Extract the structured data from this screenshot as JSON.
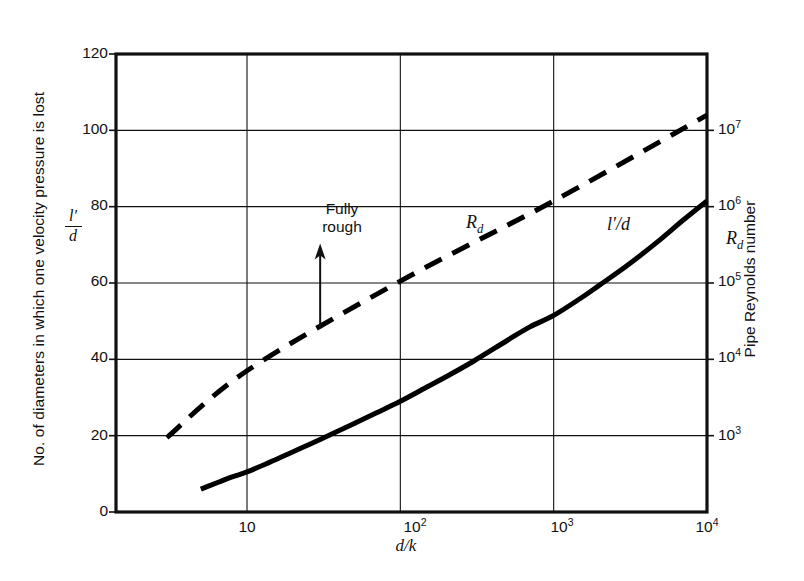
{
  "chart_data": {
    "type": "line",
    "title": "",
    "xlabel": "d/k",
    "ylabel": "No. of diameters in which one velocity pressure is lost",
    "ylabel_symbol_numerator": "l′",
    "ylabel_symbol_denominator": "d",
    "y2label": "Pipe Reynolds number",
    "y2label_symbol": "R",
    "y2label_symbol_sub": "d",
    "xscale": "log",
    "xlim": [
      3,
      10000
    ],
    "ylim": [
      0,
      120
    ],
    "grid": true,
    "legend_position": "inline-labels",
    "x_ticks": [
      {
        "value": 10,
        "label": "10"
      },
      {
        "value": 100,
        "label": "10",
        "exp": "2"
      },
      {
        "value": 1000,
        "label": "10",
        "exp": "3"
      },
      {
        "value": 10000,
        "label": "10",
        "exp": "4"
      }
    ],
    "y_ticks": [
      {
        "value": 0,
        "label": "0"
      },
      {
        "value": 20,
        "label": "20"
      },
      {
        "value": 40,
        "label": "40"
      },
      {
        "value": 60,
        "label": "60"
      },
      {
        "value": 80,
        "label": "80"
      },
      {
        "value": 100,
        "label": "100"
      },
      {
        "value": 120,
        "label": "120"
      }
    ],
    "y2_ticks": [
      {
        "y": 20,
        "label": "10",
        "exp": "3"
      },
      {
        "y": 40,
        "label": "10",
        "exp": "4"
      },
      {
        "y": 60,
        "label": "10",
        "exp": "5"
      },
      {
        "y": 80,
        "label": "10",
        "exp": "6"
      },
      {
        "y": 100,
        "label": "10",
        "exp": "7"
      }
    ],
    "series": [
      {
        "name": "l′/d",
        "label": "l′/d",
        "style": "solid",
        "color": "#000000",
        "width": 5,
        "points": [
          [
            5.0,
            6.0
          ],
          [
            6.5,
            7.8
          ],
          [
            8.0,
            9.2
          ],
          [
            10.0,
            10.5
          ],
          [
            14.0,
            13.0
          ],
          [
            20.0,
            15.8
          ],
          [
            30.0,
            19.0
          ],
          [
            50.0,
            23.2
          ],
          [
            70.0,
            26.0
          ],
          [
            100.0,
            29.0
          ],
          [
            150.0,
            32.8
          ],
          [
            200.0,
            35.5
          ],
          [
            300.0,
            39.5
          ],
          [
            500.0,
            45.0
          ],
          [
            700.0,
            48.5
          ],
          [
            1000.0,
            51.5
          ],
          [
            1500.0,
            56.0
          ],
          [
            2000.0,
            59.5
          ],
          [
            3000.0,
            64.5
          ],
          [
            5000.0,
            71.5
          ],
          [
            7000.0,
            76.5
          ],
          [
            10000.0,
            81.5
          ]
        ]
      },
      {
        "name": "R_d",
        "label": "R",
        "label_sub": "d",
        "style": "dashed",
        "color": "#000000",
        "width": 5,
        "points": [
          [
            3.0,
            19.5
          ],
          [
            10.0,
            37.0
          ],
          [
            100.0,
            60.5
          ],
          [
            1000.0,
            81.5
          ],
          [
            10000.0,
            104.0
          ]
        ]
      }
    ],
    "annotations": [
      {
        "name": "fully-rough",
        "text_line1": "Fully",
        "text_line2": "rough",
        "arrow_from": [
          30,
          48
        ],
        "arrow_to": [
          30,
          68
        ]
      }
    ]
  }
}
